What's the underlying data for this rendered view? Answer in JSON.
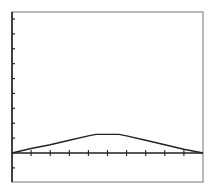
{
  "chart_data": {
    "type": "line",
    "title": "",
    "xlabel": "",
    "ylabel": "",
    "grid": false,
    "legend": null,
    "x_ticks_count": 9,
    "y_ticks_count": 10,
    "xlim": [
      0,
      10
    ],
    "ylim": [
      -1,
      9
    ],
    "x": [
      0,
      1,
      2,
      3,
      4,
      4.4,
      5.6,
      6,
      7,
      8,
      9,
      10
    ],
    "series": [
      {
        "name": "curve",
        "values": [
          0,
          0.3,
          0.55,
          0.85,
          1.15,
          1.25,
          1.25,
          1.15,
          0.85,
          0.55,
          0.25,
          0
        ]
      }
    ]
  },
  "colors": {
    "frame": "#8a8a8a",
    "axis": "#222222",
    "curve": "#222222",
    "background": "#ffffff"
  },
  "layout": {
    "frame": {
      "left": 12,
      "top": 12,
      "right": 203,
      "bottom": 182
    },
    "x_axis_y": 153
  }
}
